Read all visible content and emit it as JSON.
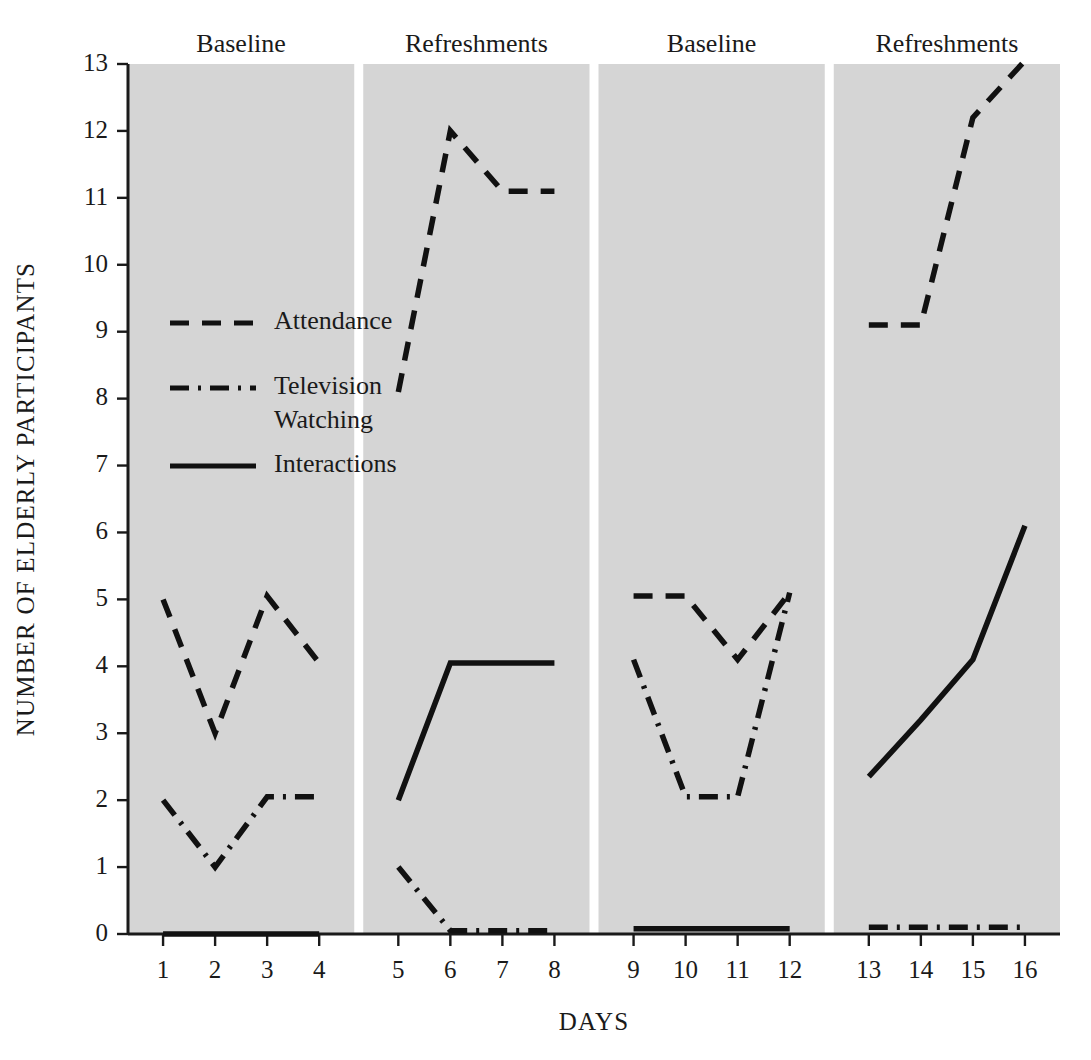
{
  "chart_data": {
    "type": "line",
    "title": "",
    "xlabel": "DAYS",
    "ylabel": "NUMBER OF ELDERLY PARTICIPANTS",
    "x": [
      1,
      2,
      3,
      4,
      5,
      6,
      7,
      8,
      9,
      10,
      11,
      12,
      13,
      14,
      15,
      16
    ],
    "xtick_labels": [
      "1",
      "2",
      "3",
      "4",
      "5",
      "6",
      "7",
      "8",
      "9",
      "10",
      "11",
      "12",
      "13",
      "14",
      "15",
      "16"
    ],
    "ytick_labels": [
      "0",
      "1",
      "2",
      "3",
      "4",
      "5",
      "6",
      "7",
      "8",
      "9",
      "10",
      "11",
      "12",
      "13"
    ],
    "ylim": [
      0,
      13
    ],
    "xlim": [
      0.5,
      16.5
    ],
    "grid": false,
    "legend_position": "inside-left",
    "phases": [
      {
        "label": "Baseline",
        "days": [
          1,
          2,
          3,
          4
        ]
      },
      {
        "label": "Refreshments",
        "days": [
          5,
          6,
          7,
          8
        ]
      },
      {
        "label": "Baseline",
        "days": [
          9,
          10,
          11,
          12
        ]
      },
      {
        "label": "Refreshments",
        "days": [
          13,
          14,
          15,
          16
        ]
      }
    ],
    "series": [
      {
        "name": "Attendance",
        "style": "dashed",
        "segments": [
          {
            "x": [
              1,
              2,
              3,
              4
            ],
            "values": [
              5.0,
              3.0,
              5.05,
              4.05
            ]
          },
          {
            "x": [
              5,
              6,
              7,
              8
            ],
            "values": [
              8.1,
              12.0,
              11.1,
              11.1
            ]
          },
          {
            "x": [
              9,
              10,
              11,
              12
            ],
            "values": [
              5.05,
              5.05,
              4.1,
              5.1
            ]
          },
          {
            "x": [
              13,
              14,
              15,
              16
            ],
            "values": [
              9.1,
              9.1,
              12.2,
              13.05
            ]
          }
        ]
      },
      {
        "name": "Television Watching",
        "style": "dash-dot",
        "segments": [
          {
            "x": [
              1,
              2,
              3,
              4
            ],
            "values": [
              2.0,
              1.0,
              2.05,
              2.05
            ]
          },
          {
            "x": [
              5,
              6,
              7,
              8
            ],
            "values": [
              1.0,
              0.05,
              0.05,
              0.05
            ]
          },
          {
            "x": [
              9,
              10,
              11,
              12
            ],
            "values": [
              4.1,
              2.05,
              2.05,
              5.1
            ]
          },
          {
            "x": [
              13,
              14,
              15,
              16
            ],
            "values": [
              0.1,
              0.1,
              0.1,
              0.1
            ]
          }
        ]
      },
      {
        "name": "Interactions",
        "style": "solid",
        "segments": [
          {
            "x": [
              1,
              2,
              3,
              4
            ],
            "values": [
              0.0,
              0.0,
              0.0,
              0.0
            ]
          },
          {
            "x": [
              5,
              6,
              7,
              8
            ],
            "values": [
              2.0,
              4.05,
              4.05,
              4.05
            ]
          },
          {
            "x": [
              9,
              10,
              11,
              12
            ],
            "values": [
              0.08,
              0.08,
              0.08,
              0.08
            ]
          },
          {
            "x": [
              13,
              14,
              15,
              16
            ],
            "values": [
              2.35,
              3.2,
              4.1,
              6.1
            ]
          }
        ]
      }
    ],
    "legend": [
      {
        "label": "Attendance",
        "style": "dashed"
      },
      {
        "label": "Television Watching",
        "style": "dash-dot"
      },
      {
        "label": "Interactions",
        "style": "solid"
      }
    ]
  }
}
